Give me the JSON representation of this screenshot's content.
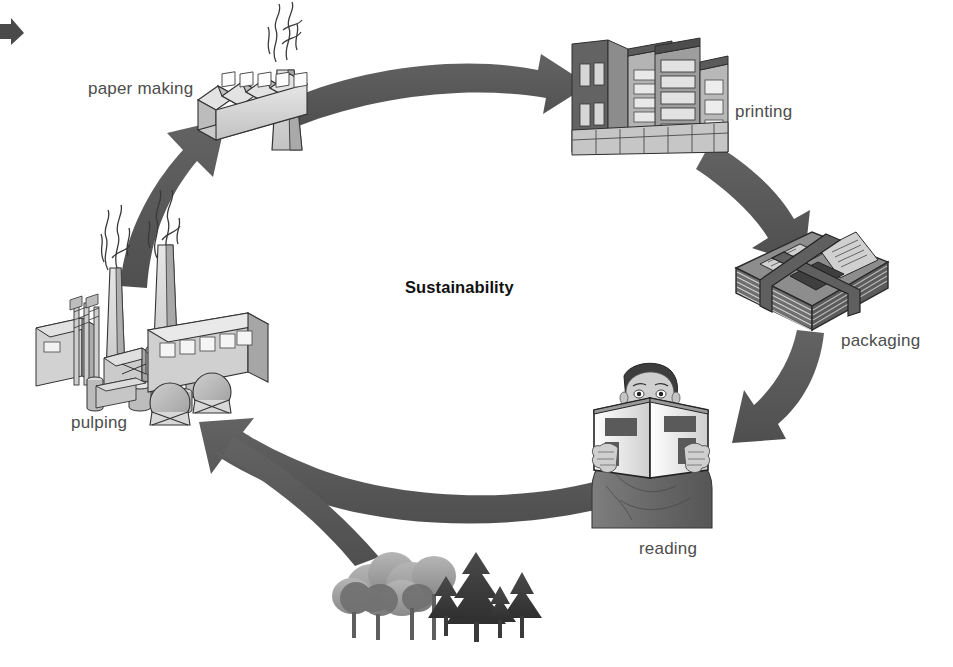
{
  "diagram": {
    "title": "Sustainability",
    "type": "cycle",
    "center_label": "Sustainability",
    "nodes": [
      {
        "id": "pulping",
        "label": "pulping",
        "icon": "pulp-mill-icon",
        "order": 1
      },
      {
        "id": "paper-making",
        "label": "paper making",
        "icon": "paper-mill-factory-icon",
        "order": 2
      },
      {
        "id": "printing",
        "label": "printing",
        "icon": "printing-plant-building-icon",
        "order": 3
      },
      {
        "id": "packaging",
        "label": "packaging",
        "icon": "newspaper-bundle-icon",
        "order": 4
      },
      {
        "id": "reading",
        "label": "reading",
        "icon": "person-reading-book-icon",
        "order": 5
      },
      {
        "id": "forest",
        "label": "",
        "icon": "trees-forest-icon",
        "order": 6
      }
    ],
    "arrows": [
      {
        "id": "arrow-pulping-to-paper-making",
        "from": "pulping",
        "to": "paper-making"
      },
      {
        "id": "arrow-paper-making-to-printing",
        "from": "paper-making",
        "to": "printing"
      },
      {
        "id": "arrow-printing-to-packaging",
        "from": "printing",
        "to": "packaging"
      },
      {
        "id": "arrow-packaging-to-reading",
        "from": "packaging",
        "to": "reading"
      },
      {
        "id": "arrow-reading-to-pulping",
        "from": "reading",
        "to": "pulping"
      },
      {
        "id": "arrow-forest-to-pulping",
        "from": "forest",
        "to": "pulping"
      },
      {
        "id": "arrow-incoming-top-left",
        "from": "",
        "to": "paper-making"
      }
    ],
    "colors": {
      "background": "#ffffff",
      "arrow": "#5a5a5a",
      "label_text": "#4d4d4d",
      "title_text": "#111111",
      "illustration_light": "#d8d8d8",
      "illustration_mid": "#9a9a9a",
      "illustration_dark": "#4a4a4a",
      "outline": "#222222"
    }
  }
}
